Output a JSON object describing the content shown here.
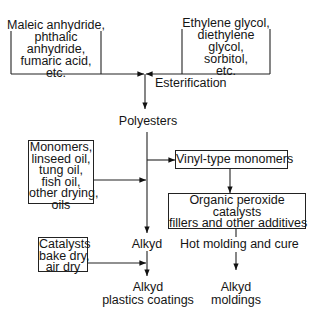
{
  "diagram": {
    "title": "",
    "nodes": {
      "acids": {
        "lines": [
          "Maleic anhydride,",
          "phthalic",
          "anhydride,",
          "fumaric acid,",
          "etc."
        ]
      },
      "glycols": {
        "lines": [
          "Ethylene glycol,",
          "diethylene",
          "glycol,",
          "sorbitol,",
          "etc."
        ]
      },
      "esterification": {
        "label": "Esterification"
      },
      "polyesters": {
        "label": "Polyesters"
      },
      "oils": {
        "lines": [
          "Monomers,",
          "linseed oil,",
          "tung oil,",
          "fish oil,",
          "other drying,",
          "oils"
        ]
      },
      "vinyl": {
        "label": "Vinyl-type monomers"
      },
      "peroxide": {
        "lines": [
          "Organic peroxide",
          "catalysts",
          "fillers and other additives"
        ]
      },
      "alkyd": {
        "label": "Alkyd"
      },
      "hot_molding": {
        "label": "Hot molding and cure"
      },
      "catalysts": {
        "lines": [
          "Catalysts",
          "bake dry,",
          "air dry"
        ]
      },
      "coatings": {
        "lines": [
          "Alkyd",
          "plastics coatings"
        ]
      },
      "moldings": {
        "lines": [
          "Alkyd",
          "moldings"
        ]
      }
    },
    "edges": [
      {
        "from": "acids",
        "to": "polyesters",
        "via": "esterification"
      },
      {
        "from": "glycols",
        "to": "polyesters",
        "via": "esterification"
      },
      {
        "from": "polyesters",
        "to": "alkyd"
      },
      {
        "from": "polyesters",
        "to": "vinyl"
      },
      {
        "from": "oils",
        "to": "alkyd"
      },
      {
        "from": "vinyl",
        "to": "peroxide"
      },
      {
        "from": "peroxide",
        "to": "hot_molding"
      },
      {
        "from": "hot_molding",
        "to": "moldings"
      },
      {
        "from": "catalysts",
        "to": "alkyd"
      },
      {
        "from": "alkyd",
        "to": "coatings"
      }
    ]
  }
}
